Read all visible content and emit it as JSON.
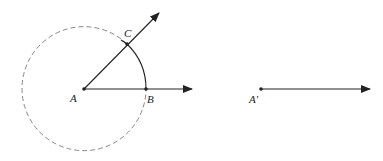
{
  "figure": {
    "points": {
      "A": {
        "label": "A",
        "x": 84,
        "y": 89
      },
      "B": {
        "label": "B",
        "x": 146,
        "y": 89
      },
      "C": {
        "label": "C",
        "x": 127,
        "y": 44
      },
      "A_prime": {
        "label": "A′",
        "x": 261,
        "y": 89
      }
    },
    "circle": {
      "center": "A",
      "radius": 62,
      "style": "dashed"
    },
    "rays": [
      {
        "from": "A",
        "through": "B",
        "end_x": 192,
        "end_y": 89
      },
      {
        "from": "A",
        "through": "C",
        "end_x": 159,
        "end_y": 13
      },
      {
        "from": "A_prime",
        "end_x": 370,
        "end_y": 89
      }
    ],
    "colors": {
      "stroke": "#222222",
      "dash": "#888888"
    }
  }
}
